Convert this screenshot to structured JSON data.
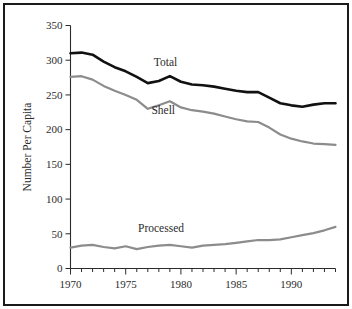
{
  "chart_data": {
    "type": "line",
    "title": "",
    "xlabel": "",
    "ylabel": "Number Per Capita",
    "xlim": [
      1970,
      1994
    ],
    "ylim": [
      0,
      350
    ],
    "yticks": [
      0,
      50,
      100,
      150,
      200,
      250,
      300,
      350
    ],
    "ytick_labels": [
      "0",
      "50",
      "100",
      "150",
      "200",
      "250",
      "300",
      "350"
    ],
    "xticks": [
      1970,
      1971,
      1972,
      1973,
      1974,
      1975,
      1976,
      1977,
      1978,
      1979,
      1980,
      1981,
      1982,
      1983,
      1984,
      1985,
      1986,
      1987,
      1988,
      1989,
      1990,
      1991,
      1992,
      1993,
      1994
    ],
    "xtick_labels_major": [
      "1970",
      "1975",
      "1980",
      "1985",
      "1990"
    ],
    "xticks_major": [
      1970,
      1975,
      1980,
      1985,
      1990
    ],
    "grid": false,
    "legend_position": "inline-annotations",
    "x": [
      1970,
      1971,
      1972,
      1973,
      1974,
      1975,
      1976,
      1977,
      1978,
      1979,
      1980,
      1981,
      1982,
      1983,
      1984,
      1985,
      1986,
      1987,
      1988,
      1989,
      1990,
      1991,
      1992,
      1993,
      1994
    ],
    "series": [
      {
        "name": "Total",
        "color": "#111111",
        "width": 2.6,
        "label": "Total",
        "label_x": 1978.6,
        "label_y": 292,
        "values": [
          310,
          311,
          308,
          298,
          290,
          284,
          276,
          267,
          270,
          277,
          269,
          265,
          264,
          262,
          259,
          256,
          254,
          254,
          246,
          238,
          235,
          233,
          236,
          238,
          238
        ]
      },
      {
        "name": "Shell",
        "color": "#8c8c8c",
        "width": 2.2,
        "label": "Shell",
        "label_x": 1978.4,
        "label_y": 222,
        "values": [
          276,
          277,
          272,
          263,
          256,
          250,
          243,
          230,
          235,
          241,
          232,
          228,
          226,
          223,
          219,
          215,
          212,
          211,
          203,
          193,
          187,
          183,
          180,
          179,
          178
        ]
      },
      {
        "name": "Processed",
        "color": "#8c8c8c",
        "width": 2.2,
        "label": "Processed",
        "label_x": 1978.2,
        "label_y": 52,
        "values": [
          30,
          33,
          34,
          31,
          29,
          32,
          28,
          31,
          33,
          34,
          32,
          30,
          33,
          34,
          35,
          37,
          39,
          41,
          41,
          42,
          45,
          48,
          51,
          55,
          60
        ]
      }
    ]
  },
  "figure": {
    "background_color": "#ffffff",
    "border_color": "#1a1a1a",
    "axis_color": "#2b2b2b"
  }
}
